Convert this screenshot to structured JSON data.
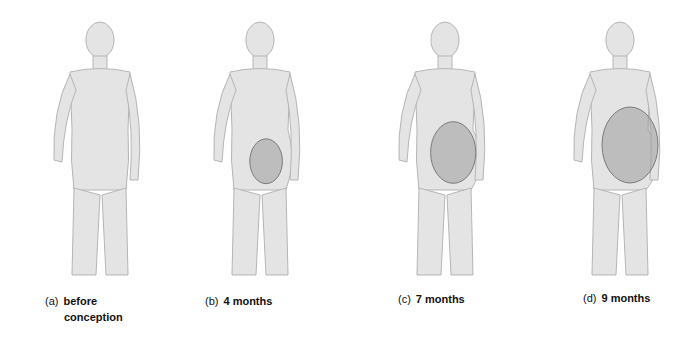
{
  "figure": {
    "panels": [
      {
        "letter": "(a)",
        "label": "before",
        "label_line2": "conception",
        "uterus_size": 0.0
      },
      {
        "letter": "(b)",
        "label": "4 months",
        "uterus_size": 0.35
      },
      {
        "letter": "(c)",
        "label": "7 months",
        "uterus_size": 0.7
      },
      {
        "letter": "(d)",
        "label": "9 months",
        "uterus_size": 1.0
      }
    ],
    "colors": {
      "body": "#e4e4e4",
      "outline": "#b5b5b5",
      "uterus": "#9c9c9c",
      "shade": "#cfcfcf"
    }
  }
}
